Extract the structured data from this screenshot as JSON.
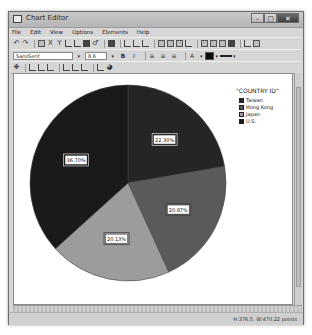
{
  "window": {
    "title": "Chart Editor",
    "controls": {
      "minimize": "–",
      "maximize": "□",
      "close": "✕"
    }
  },
  "menubar": {
    "items": [
      {
        "label": "File"
      },
      {
        "label": "Edit"
      },
      {
        "label": "View"
      },
      {
        "label": "Options"
      },
      {
        "label": "Elements"
      },
      {
        "label": "Help"
      }
    ]
  },
  "format_toolbar": {
    "font_family": "SansSerif",
    "font_size": "8.6",
    "bold_label": "B",
    "italic_label": "I",
    "text_color_label": "A",
    "fill_color": "#0a0a0a"
  },
  "chart_data": {
    "type": "pie",
    "title": "",
    "legend_title": "\"COUNTRY ID\"",
    "legend_position": "right",
    "categories": [
      "Taiwan",
      "Hong Kong",
      "Japan",
      "U.S."
    ],
    "values": [
      22.3,
      20.87,
      20.13,
      36.7
    ],
    "labels": [
      "22.30%",
      "20.87%",
      "20.13%",
      "36.70%"
    ],
    "colors": [
      "#252525",
      "#5a5a5a",
      "#9c9c9c",
      "#1a1a1a"
    ],
    "start_angle_deg": 0,
    "direction": "clockwise"
  },
  "statusbar": {
    "coordinates": "H:376.5, W:470.22 points"
  }
}
